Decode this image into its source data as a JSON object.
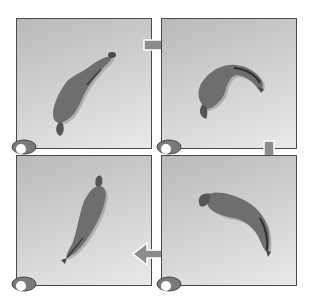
{
  "figure": {
    "panels": [
      {
        "id": 1,
        "pose": "horse-straight-diagonal",
        "position": "top-left"
      },
      {
        "id": 2,
        "pose": "horse-bending-head-down-right",
        "position": "top-right"
      },
      {
        "id": 3,
        "pose": "horse-straight-diagonal-reverse",
        "position": "bottom-left"
      },
      {
        "id": 4,
        "pose": "horse-curving-head-down",
        "position": "bottom-right"
      }
    ],
    "arrows": [
      {
        "from": 1,
        "to": 2,
        "direction": "right"
      },
      {
        "from": 2,
        "to": 4,
        "direction": "down"
      },
      {
        "from": 4,
        "to": 3,
        "direction": "left"
      }
    ],
    "colors": {
      "horse_body": "#6e6e6e",
      "horse_shadow": "#8a8a8a",
      "panel_border": "#4a4a4a",
      "arrow": "#8c8c8c",
      "hoof_icon": "#7a7a7a"
    }
  }
}
